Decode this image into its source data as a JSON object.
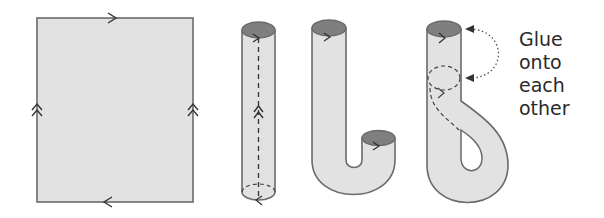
{
  "figure": {
    "panels": [
      {
        "name": "square-with-edge-identifications",
        "description": "Rectangle with single arrows on top/bottom edges (opposite directions) and double arrows on left/right edges (same direction)"
      },
      {
        "name": "cylinder",
        "description": "Rectangle rolled into a cylinder along the double-arrow edges"
      },
      {
        "name": "bent-tube",
        "description": "Cylinder bent into a J shape"
      },
      {
        "name": "klein-bottle-construction",
        "description": "Tube passed through its own wall so the ends can be glued"
      }
    ],
    "annotation": {
      "lines": [
        "Glue",
        "onto",
        "each",
        "other"
      ]
    },
    "colors": {
      "fill": "#e2e2e2",
      "stroke": "#6b6b6b",
      "end_cap": "#7f7f7f",
      "text": "#2a2a2a"
    }
  }
}
